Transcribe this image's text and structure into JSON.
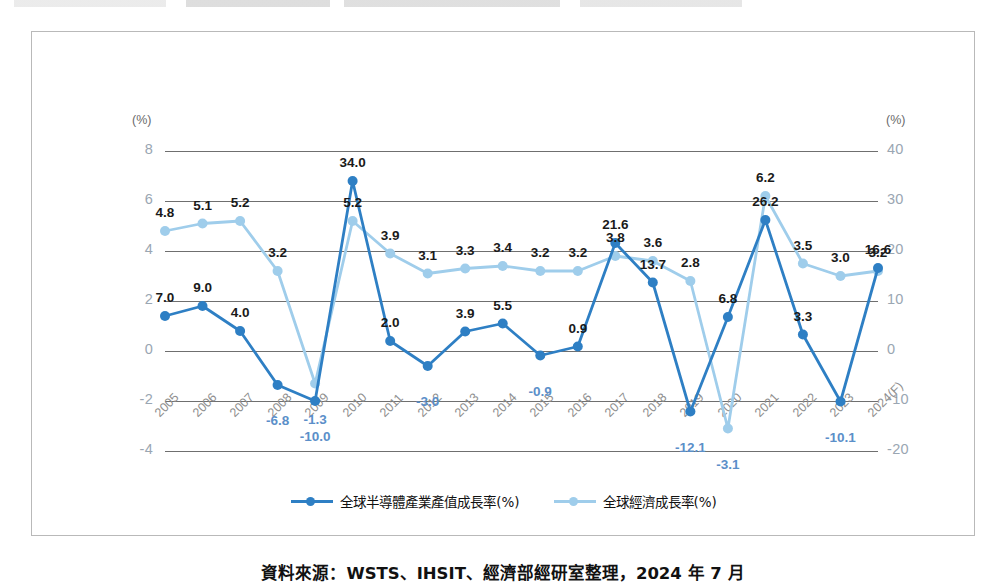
{
  "caption": "資料來源：WSTS、IHSIT、經濟部經研室整理，2024 年 7 月",
  "axes": {
    "left_unit": "(%)",
    "right_unit": "(%)",
    "left_ticks": [
      "8",
      "6",
      "4",
      "2",
      "0",
      "-2",
      "-4"
    ],
    "right_ticks": [
      "40",
      "30",
      "20",
      "10",
      "0",
      "-10",
      "-20"
    ]
  },
  "legend": {
    "items": [
      {
        "label": "全球半導體產業產值成長率(%)",
        "color": "#2e7fc4"
      },
      {
        "label": "全球經濟成長率(%)",
        "color": "#9fcdeb"
      }
    ]
  },
  "chart_data": {
    "type": "line",
    "title": "",
    "xlabel": "",
    "ylabel": "",
    "grid": true,
    "legend_position": "bottom",
    "categories": [
      "2005",
      "2006",
      "2007",
      "2008",
      "2009",
      "2010",
      "2011",
      "2012",
      "2013",
      "2014",
      "2015",
      "2016",
      "2017",
      "2018",
      "2019",
      "2020",
      "2021",
      "2022",
      "2023",
      "2024(F)"
    ],
    "left_axis": {
      "label": "(%)",
      "ylim": [
        -4,
        8
      ],
      "ticks": [
        8,
        6,
        4,
        2,
        0,
        -2,
        -4
      ],
      "series": "全球經濟成長率(%)"
    },
    "right_axis": {
      "label": "(%)",
      "ylim": [
        -20,
        40
      ],
      "ticks": [
        40,
        30,
        20,
        10,
        0,
        -10,
        -20
      ],
      "series": "全球半導體產業產值成長率(%)"
    },
    "series": [
      {
        "name": "全球半導體產業產值成長率(%)",
        "color": "#2e7fc4",
        "axis": "right",
        "values": [
          7.0,
          9.0,
          4.0,
          -6.8,
          -10.0,
          34.0,
          2.0,
          -3.0,
          3.9,
          5.5,
          -0.9,
          0.9,
          21.6,
          13.7,
          -12.1,
          6.8,
          26.2,
          3.3,
          -10.1,
          16.6
        ],
        "labels": [
          "7.0",
          "9.0",
          "4.0",
          "-6.8",
          "-10.0",
          "34.0",
          "2.0",
          "-3.0",
          "3.9",
          "5.5",
          "-0.9",
          "0.9",
          "21.6",
          "13.7",
          "-12.1",
          "6.8",
          "26.2",
          "3.3",
          "-10.1",
          "16.6"
        ]
      },
      {
        "name": "全球經濟成長率(%)",
        "color": "#9fcdeb",
        "axis": "left",
        "values": [
          4.8,
          5.1,
          5.2,
          3.2,
          -1.3,
          5.2,
          3.9,
          3.1,
          3.3,
          3.4,
          3.2,
          3.2,
          3.8,
          3.6,
          2.8,
          -3.1,
          6.2,
          3.5,
          3.0,
          3.2
        ],
        "labels": [
          "4.8",
          "5.1",
          "5.2",
          "3.2",
          "-1.3",
          "5.2",
          "3.9",
          "3.1",
          "3.3",
          "3.4",
          "3.2",
          "3.2",
          "3.8",
          "3.6",
          "2.8",
          "-3.1",
          "6.2",
          "3.5",
          "3.0",
          "3.2"
        ]
      }
    ]
  }
}
